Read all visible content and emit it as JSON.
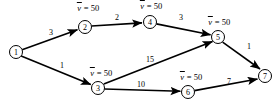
{
  "figure": {
    "type": "directed-network-diagram",
    "width": 279,
    "height": 109,
    "background_color": "#ffffff",
    "line_color": "#000000"
  },
  "nodes": [
    {
      "id": "1",
      "label": "1",
      "cx": 16,
      "cy": 52,
      "r": 6.5
    },
    {
      "id": "2",
      "label": "2",
      "cx": 85,
      "cy": 27,
      "r": 6.5
    },
    {
      "id": "3",
      "label": "3",
      "cx": 98,
      "cy": 88,
      "r": 6.5
    },
    {
      "id": "4",
      "label": "4",
      "cx": 150,
      "cy": 22,
      "r": 6.5
    },
    {
      "id": "5",
      "label": "5",
      "cx": 218,
      "cy": 37,
      "r": 6.5
    },
    {
      "id": "6",
      "label": "6",
      "cx": 188,
      "cy": 92,
      "r": 6.5
    },
    {
      "id": "7",
      "label": "7",
      "cx": 265,
      "cy": 76,
      "r": 6.5
    }
  ],
  "edges": [
    {
      "id": "e12",
      "from": "1",
      "to": "2",
      "weight": "3",
      "label_x": 51,
      "label_y": 32
    },
    {
      "id": "e24",
      "from": "2",
      "to": "4",
      "weight": "2",
      "label_x": 117,
      "label_y": 17
    },
    {
      "id": "e45",
      "from": "4",
      "to": "5",
      "weight": "3",
      "label_x": 181,
      "label_y": 17
    },
    {
      "id": "e13",
      "from": "1",
      "to": "3",
      "weight": "1",
      "label_x": 62,
      "label_y": 65
    },
    {
      "id": "e35",
      "from": "3",
      "to": "5",
      "weight": "15",
      "label_x": 150,
      "label_y": 59
    },
    {
      "id": "e36",
      "from": "3",
      "to": "6",
      "weight": "10",
      "label_x": 141,
      "label_y": 84
    },
    {
      "id": "e57",
      "from": "5",
      "to": "7",
      "weight": "1",
      "label_x": 249,
      "label_y": 46
    },
    {
      "id": "e67",
      "from": "6",
      "to": "7",
      "weight": "7",
      "label_x": 229,
      "label_y": 81
    }
  ],
  "annotations": [
    {
      "id": "a2",
      "node": "2",
      "text": " = 50",
      "symbol": "v",
      "x": 88,
      "y": 4
    },
    {
      "id": "a4",
      "node": "4",
      "text": " = 50",
      "symbol": "v",
      "x": 151,
      "y": 2
    },
    {
      "id": "a5",
      "node": "5",
      "text": " = 50",
      "symbol": "v",
      "x": 219,
      "y": 18
    },
    {
      "id": "a3",
      "node": "3",
      "text": " = 50",
      "symbol": "v",
      "x": 101,
      "y": 69
    },
    {
      "id": "a6",
      "node": "6",
      "text": " = 50",
      "symbol": "v",
      "x": 191,
      "y": 73
    }
  ]
}
